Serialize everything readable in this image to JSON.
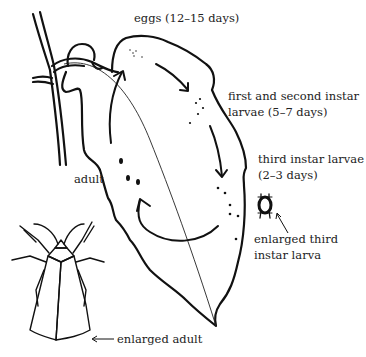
{
  "diagram": {
    "type": "insect-life-cycle",
    "stroke_color": "#111111",
    "background": "#ffffff",
    "labels": {
      "eggs": "eggs (12–15 days)",
      "first_second_line1": "first and second instar",
      "first_second_line2": "larvae (5–7 days)",
      "third_line1": "third instar larvae",
      "third_line2": "(2–3 days)",
      "enlarged_larva_line1": "enlarged third",
      "enlarged_larva_line2": "instar larva",
      "adult": "adult",
      "enlarged_adult": "enlarged adult"
    },
    "stages": [
      {
        "id": "eggs",
        "label": "eggs (12–15 days)"
      },
      {
        "id": "first-second-instar",
        "label": "first and second instar larvae (5–7 days)"
      },
      {
        "id": "third-instar",
        "label": "third instar larvae (2–3 days)"
      },
      {
        "id": "adult",
        "label": "adult"
      }
    ],
    "cycle_order": [
      "eggs",
      "first-second-instar",
      "third-instar",
      "adult",
      "eggs"
    ]
  }
}
